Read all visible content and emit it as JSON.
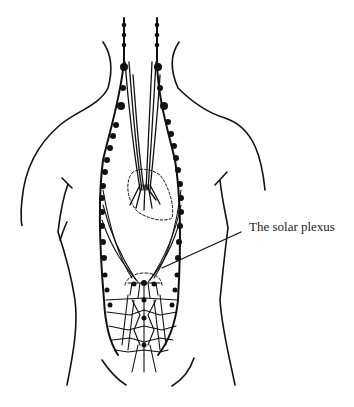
{
  "figure": {
    "annotations": [
      {
        "id": "solar-plexus",
        "text": "The solar plexus"
      }
    ],
    "colors": {
      "ink": "#111111",
      "background": "#ffffff"
    }
  }
}
